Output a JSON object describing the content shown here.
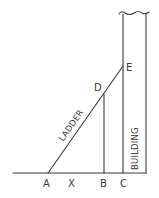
{
  "diagram": {
    "type": "geometry-sketch",
    "points": {
      "A": {
        "label": "A",
        "x": 48,
        "y": 173
      },
      "X": {
        "label": "X",
        "x": 72,
        "y": 173
      },
      "B": {
        "label": "B",
        "x": 104,
        "y": 173
      },
      "C": {
        "label": "C",
        "x": 123,
        "y": 173
      },
      "D": {
        "label": "D",
        "x": 104,
        "y": 94
      },
      "E": {
        "label": "E",
        "x": 123,
        "y": 66
      }
    },
    "labels": {
      "ladder": "LADDER",
      "building": "BUILDING",
      "A": "A",
      "X": "X",
      "B": "B",
      "C": "C",
      "D": "D",
      "E": "E"
    },
    "segments": [
      {
        "name": "ground",
        "from": [
          13,
          173
        ],
        "to": [
          146,
          173
        ]
      },
      {
        "name": "ladder-AE",
        "from": [
          48,
          173
        ],
        "to": [
          123,
          66
        ]
      },
      {
        "name": "segment-DB",
        "from": [
          104,
          94
        ],
        "to": [
          104,
          173
        ]
      },
      {
        "name": "building-left-wall",
        "from": [
          123,
          15
        ],
        "to": [
          123,
          173
        ]
      },
      {
        "name": "building-right-wall",
        "from": [
          146,
          15
        ],
        "to": [
          146,
          173
        ]
      }
    ],
    "colors": {
      "ink": "#3a3a3a",
      "background": "#ffffff"
    }
  }
}
